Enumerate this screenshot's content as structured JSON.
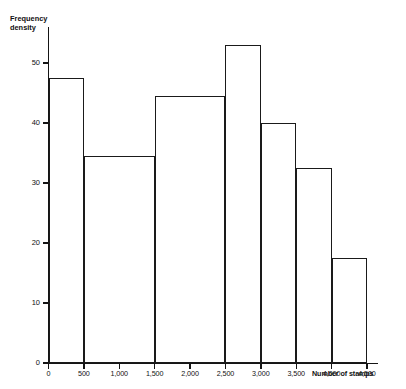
{
  "chart_data": {
    "type": "bar",
    "title": "",
    "subtitle": "",
    "xlabel": "Number of stamps",
    "ylabel": "Frequency density",
    "ylabel_lines": [
      "Frequency",
      "density"
    ],
    "grid": false,
    "legend": null,
    "xlim": [
      0,
      4500
    ],
    "ylim": [
      0,
      55
    ],
    "ytick_labels": [
      "0",
      "10",
      "20",
      "30",
      "40",
      "50"
    ],
    "ytick_values": [
      0,
      10,
      20,
      30,
      40,
      50
    ],
    "xtick_labels": [
      "0",
      "500",
      "1,000",
      "1,500",
      "2,000",
      "2,500",
      "3,000",
      "3,500",
      "4,000",
      "4,500"
    ],
    "xtick_values": [
      0,
      500,
      1000,
      1500,
      2000,
      2500,
      3000,
      3500,
      4000,
      4500
    ],
    "bins": [
      {
        "label": "0-500",
        "x0": 0,
        "x1": 500,
        "value": 47.5
      },
      {
        "label": "500-1,500",
        "x0": 500,
        "x1": 1500,
        "value": 34.5
      },
      {
        "label": "1,500-2,500",
        "x0": 1500,
        "x1": 2500,
        "value": 44.5
      },
      {
        "label": "2,500-3,000",
        "x0": 2500,
        "x1": 3000,
        "value": 53.0
      },
      {
        "label": "3,000-3,500",
        "x0": 3000,
        "x1": 3500,
        "value": 40.0
      },
      {
        "label": "3,500-4,000",
        "x0": 3500,
        "x1": 4000,
        "value": 32.5
      },
      {
        "label": "4,000-4,500",
        "x0": 4000,
        "x1": 4500,
        "value": 17.5
      }
    ],
    "colors": {
      "line": "#1a1a1a",
      "fill": "#ffffff",
      "axis": "#151515"
    }
  }
}
